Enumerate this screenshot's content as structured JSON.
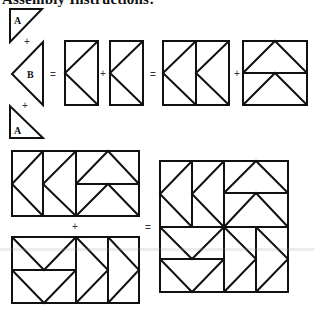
{
  "heading": "Assembly Instructions:",
  "pieces": {
    "triangle_a_label": "A",
    "triangle_b_label": "B"
  },
  "operators": {
    "plus": "+",
    "equals": "="
  },
  "steps": [
    "Sew triangle A + triangle B + triangle A into a flying-geese unit",
    "Join two vertical flying-geese units",
    "Add a pair of horizontal flying-geese units to form a row",
    "Join two rows to complete the block"
  ],
  "colors": {
    "line": "#111111",
    "background": "#ffffff"
  }
}
